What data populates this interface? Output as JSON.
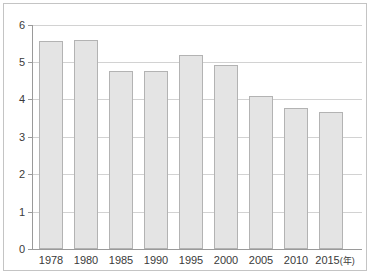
{
  "chart_data": {
    "type": "bar",
    "title": "",
    "xlabel": "年",
    "ylabel": "",
    "categories": [
      "1978",
      "1980",
      "1985",
      "1990",
      "1995",
      "2000",
      "2005",
      "2010",
      "2015"
    ],
    "values": [
      5.56,
      5.59,
      4.76,
      4.78,
      5.19,
      4.93,
      4.1,
      3.79,
      3.68
    ],
    "ylim": [
      0,
      6
    ],
    "ytick_labels": [
      "0",
      "1",
      "2",
      "3",
      "4",
      "5",
      "6"
    ],
    "ytick_values": [
      0,
      1,
      2,
      3,
      4,
      5,
      6
    ],
    "xtick_labels": [
      "1978",
      "1980",
      "1985",
      "1990",
      "1995",
      "2000",
      "2005",
      "2010",
      "2015"
    ],
    "x_axis_unit_label": "(年)",
    "grid": true,
    "legend": false,
    "legend_position": "none",
    "bar_fill_color": "#e4e4e4",
    "bar_border_color": "#b3b3b3",
    "grid_color": "#d2d2d2",
    "axis_color": "#9a9a9a",
    "frame_color": "#c4c4c4",
    "text_color": "#3a3a3a"
  }
}
